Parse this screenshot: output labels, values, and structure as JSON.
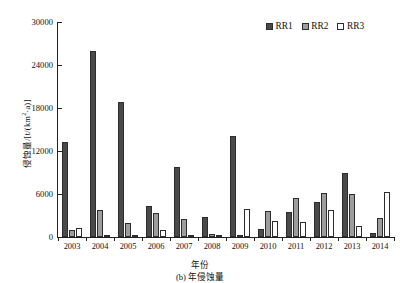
{
  "chart_data": {
    "type": "bar",
    "title": "",
    "caption": "(b) 年侵蚀量",
    "xlabel": "年份",
    "ylabel": "侵蚀量/[t/(km²·a)]",
    "ylabel_parts": {
      "main": "侵蚀量/[t/(km",
      "sup": "2",
      "tail": "·a)]"
    },
    "categories": [
      "2003",
      "2004",
      "2005",
      "2006",
      "2007",
      "2008",
      "2009",
      "2010",
      "2011",
      "2012",
      "2013",
      "2014"
    ],
    "ylim": [
      0,
      30000
    ],
    "yticks": [
      0,
      6000,
      12000,
      18000,
      24000,
      30000
    ],
    "ytick_labels": [
      "0",
      "6000",
      "12000",
      "18000",
      "24000",
      "30000"
    ],
    "grid": false,
    "legend_position": "top-right",
    "series": [
      {
        "name": "RR1",
        "color": "#4a4a4a",
        "values": [
          13200,
          25900,
          18800,
          4300,
          9800,
          2800,
          14100,
          1100,
          3500,
          4900,
          8900,
          600
        ]
      },
      {
        "name": "RR2",
        "color": "#9d9d9d",
        "values": [
          1000,
          3800,
          1900,
          3300,
          2500,
          400,
          300,
          3600,
          5500,
          6100,
          6000,
          2600
        ]
      },
      {
        "name": "RR3",
        "color": "#ffffff",
        "values": [
          1300,
          300,
          200,
          1000,
          150,
          100,
          3900,
          2200,
          2100,
          3700,
          1500,
          6300
        ]
      }
    ]
  },
  "legend": {
    "items": [
      {
        "label": "RR1",
        "swatch": "rr1"
      },
      {
        "label": "RR2",
        "swatch": "rr2"
      },
      {
        "label": "RR3",
        "swatch": "rr3"
      }
    ]
  }
}
